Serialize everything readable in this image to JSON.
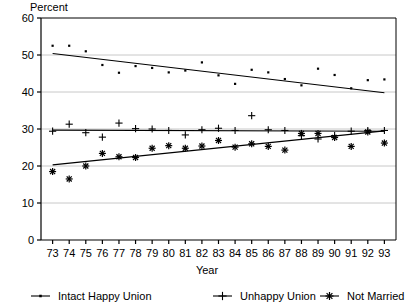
{
  "chart_data": {
    "type": "scatter",
    "title": "",
    "xlabel": "Year",
    "ylabel": "Percent",
    "ylabel_position": "top-left",
    "grid": true,
    "grid_style": "light-horizontal",
    "legend_position": "bottom",
    "xlim": [
      72.3,
      93.7
    ],
    "ylim": [
      0,
      60
    ],
    "yticks": [
      0,
      10,
      20,
      30,
      40,
      50,
      60
    ],
    "ytick_labels": [
      "0",
      "10",
      "20",
      "30",
      "40",
      "50",
      "60"
    ],
    "x": [
      73,
      74,
      75,
      76,
      77,
      78,
      79,
      80,
      81,
      82,
      83,
      84,
      85,
      86,
      87,
      88,
      89,
      90,
      91,
      92,
      93
    ],
    "xtick_labels": [
      "73",
      "74",
      "75",
      "76",
      "77",
      "78",
      "79",
      "80",
      "81",
      "82",
      "83",
      "84",
      "85",
      "86",
      "87",
      "88",
      "89",
      "90",
      "91",
      "92",
      "93"
    ],
    "series": [
      {
        "name": "Intact Happy Union",
        "marker": "dot",
        "legend_marker": "dot-with-line",
        "values": [
          52.5,
          52.5,
          51.0,
          47.3,
          45.2,
          47.0,
          46.5,
          45.3,
          45.8,
          48.0,
          44.5,
          42.2,
          46.0,
          45.3,
          43.5,
          41.8,
          46.3,
          44.6,
          41.0,
          43.2,
          43.4
        ],
        "trend": {
          "start_year": 73,
          "start_value": 50.4,
          "end_year": 93,
          "end_value": 39.8
        }
      },
      {
        "name": "Unhappy Union",
        "marker": "plus",
        "legend_marker": "plus-with-line",
        "values": [
          29.4,
          31.3,
          29.0,
          27.8,
          31.6,
          30.1,
          30.0,
          29.6,
          28.4,
          29.8,
          30.2,
          29.6,
          33.6,
          29.8,
          29.6,
          28.2,
          27.3,
          28.2,
          29.4,
          29.6,
          29.6
        ],
        "trend": {
          "start_year": 73,
          "start_value": 29.7,
          "end_year": 93,
          "end_value": 29.4
        }
      },
      {
        "name": "Not Married",
        "marker": "asterisk",
        "legend_marker": "asterisk-with-line",
        "values": [
          18.5,
          16.5,
          20.0,
          23.4,
          22.5,
          22.3,
          24.8,
          25.5,
          24.8,
          25.4,
          26.9,
          25.1,
          26.0,
          25.3,
          24.3,
          28.8,
          28.8,
          27.7,
          25.3,
          29.2,
          26.2
        ],
        "trend": {
          "start_year": 73,
          "start_value": 20.3,
          "end_year": 93,
          "end_value": 29.5
        }
      }
    ]
  },
  "legend": {
    "items": [
      {
        "label": "Intact Happy Union",
        "marker": "dot"
      },
      {
        "label": "Unhappy Union",
        "marker": "plus"
      },
      {
        "label": "Not Married",
        "marker": "asterisk"
      }
    ]
  },
  "colors": {
    "axis": "#000000",
    "grid": "#c8c8c8",
    "marker": "#000000",
    "trend": "#000000",
    "background": "#ffffff"
  }
}
